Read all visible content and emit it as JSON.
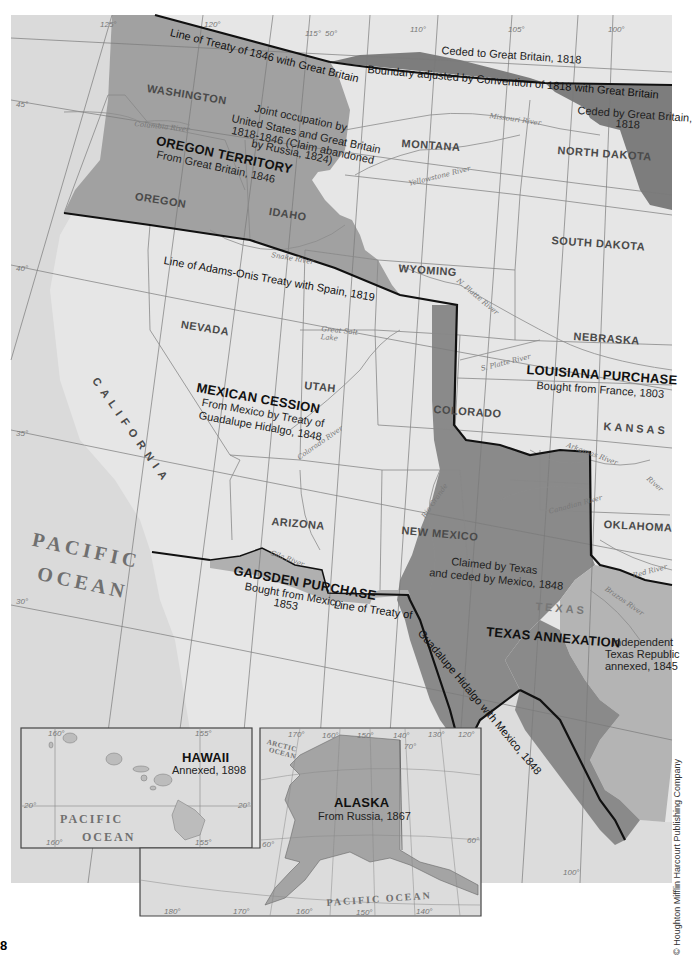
{
  "page": {
    "page_number": "8",
    "credit": "© Houghton Mifflin Harcourt Publishing Company"
  },
  "colors": {
    "background_land": "#e6e6e6",
    "oregon_territory": "#a0a0a0",
    "mexican_cession": "#e2e2e2",
    "louisiana_purchase": "#e8e8e8",
    "texas_annexation": "#8a8a8a",
    "texas_republic": "#b4b4b4",
    "gadsden_purchase": "#b0b0b0",
    "ceded_1818": "#7d7d7d",
    "alaska": "#a4a4a4",
    "ocean": "#d9d9d9",
    "boundary_line": "#111111",
    "river": "#8c8c8c",
    "gridline": "#777777"
  },
  "regions": {
    "oregon": {
      "title": "OREGON TERRITORY",
      "subtitle": "From Great Britain, 1846"
    },
    "joint_occupation": {
      "line1": "Joint occupation by",
      "line2": "United States and Great Britain",
      "line3": "1818-1846 (Claim abandoned",
      "line4": "by Russia, 1824)"
    },
    "mexican_cession": {
      "title": "MEXICAN CESSION",
      "line1": "From Mexico by Treaty of",
      "line2": "Guadalupe Hidalgo, 1848"
    },
    "louisiana": {
      "title": "LOUISIANA PURCHASE",
      "subtitle": "Bought from France, 1803"
    },
    "gadsden": {
      "title": "GADSDEN PURCHASE",
      "line1": "Bought from Mexico",
      "line2": "1853"
    },
    "texas": {
      "title": "TEXAS ANNEXATION",
      "claimed1": "Claimed by Texas",
      "claimed2": "and ceded by Mexico, 1848",
      "republic1": "Independent",
      "republic2": "Texas Republic",
      "republic3": "annexed, 1845"
    },
    "ceded_to_gb": "Ceded to Great Britain, 1818",
    "ceded_by_gb1": "Ceded by Great Britain,",
    "ceded_by_gb2": "1818"
  },
  "treaty_lines": {
    "line_1846": "Line of Treaty of 1846 with Great Britain",
    "convention_1818": "Boundary adjusted by Convention of 1818 with Great Britain",
    "adams_onis": "Line of Adams-Onis Treaty with Spain, 1819",
    "guadalupe_a": "Line of Treaty of",
    "guadalupe_b": "Guadalupe Hidalgo with Mexico, 1848"
  },
  "states": [
    "WASHINGTON",
    "OREGON",
    "IDAHO",
    "MONTANA",
    "NORTH DAKOTA",
    "SOUTH DAKOTA",
    "WYOMING",
    "NEBRASKA",
    "NEVADA",
    "UTAH",
    "CALIFORNIA",
    "COLORADO",
    "KANSAS",
    "ARIZONA",
    "NEW MEXICO",
    "OKLAHOMA",
    "TEXAS"
  ],
  "rivers": [
    "Columbia River",
    "Snake River",
    "Missouri River",
    "Yellowstone River",
    "N. Platte River",
    "S. Platte River",
    "Great Salt Lake",
    "Colorado River",
    "Rio Grande",
    "Gila River",
    "Arkansas River",
    "Canadian River",
    "Red River",
    "Brazos River",
    "River"
  ],
  "oceans": {
    "pacific1": "PACIFIC",
    "pacific2": "OCEAN",
    "arctic1": "ARCTIC",
    "arctic2": "OCEAN",
    "pacific_alaska": "PACIFIC OCEAN"
  },
  "degrees": {
    "d125": "125°",
    "d120": "120°",
    "d115": "115°",
    "d50": "50°",
    "d110": "110°",
    "d105": "105°",
    "d100": "100°",
    "d45": "45°",
    "d40": "40°",
    "d35": "35°",
    "d30": "30°",
    "d100b": "100°"
  },
  "insets": {
    "hawaii": {
      "title": "HAWAII",
      "subtitle": "Annexed, 1898",
      "ocean1": "PACIFIC",
      "ocean2": "OCEAN",
      "d160a": "160°",
      "d155a": "155°",
      "d20a": "20°",
      "d20b": "20°",
      "d160b": "160°",
      "d155b": "155°"
    },
    "alaska": {
      "title": "ALASKA",
      "subtitle": "From Russia, 1867",
      "d170": "170°",
      "d160": "160°",
      "d150": "150°",
      "d140": "140°",
      "d130": "130°",
      "d120": "120°",
      "d70": "70°",
      "d60a": "60°",
      "d60b": "60°",
      "d180": "180°",
      "d170b": "170°",
      "d160b": "160°",
      "d150b": "150°",
      "d140b": "140°"
    }
  }
}
